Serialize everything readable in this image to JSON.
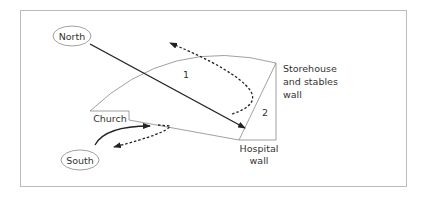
{
  "labels": {
    "north": "North",
    "south": "South",
    "church": "Church",
    "region1": "1",
    "region2": "2",
    "storehouse_line1": "Storehouse",
    "storehouse_line2": "and stables",
    "storehouse_line3": "wall",
    "hospital_line1": "Hospital",
    "hospital_line2": "wall"
  },
  "colors": {
    "frame": "#bbbbbb",
    "outline": "#888888",
    "arrow": "#222222",
    "text": "#333333"
  }
}
